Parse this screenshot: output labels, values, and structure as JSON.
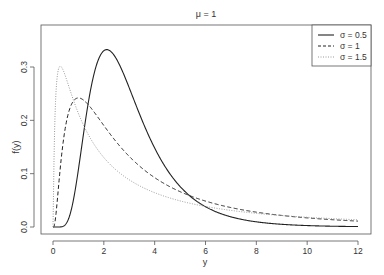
{
  "chart_data": {
    "type": "line",
    "title": "μ = 1",
    "xlabel": "y",
    "ylabel": "f(y)",
    "xlim": [
      -0.5,
      12.5
    ],
    "ylim": [
      0,
      0.35
    ],
    "xticks": [
      0,
      2,
      4,
      6,
      8,
      10,
      12
    ],
    "xtick_labels": [
      "0",
      "2",
      "4",
      "6",
      "8",
      "10",
      "12"
    ],
    "yticks": [
      0.0,
      0.1,
      0.2,
      0.3
    ],
    "ytick_labels": [
      "0.0",
      "0.1",
      "0.2",
      "0.3"
    ],
    "grid": false,
    "legend_position": "top-right",
    "distribution": "lognormal",
    "mu": 1,
    "series": [
      {
        "name": "σ = 0.5",
        "sigma": 0.5,
        "style": "solid",
        "x": [
          0,
          0.5,
          1,
          1.5,
          2,
          2.12,
          2.5,
          3,
          4,
          5,
          6,
          8,
          10,
          12
        ],
        "values": [
          0,
          0.0045,
          0.108,
          0.283,
          0.33,
          0.3326,
          0.315,
          0.252,
          0.135,
          0.065,
          0.03,
          0.006,
          0.0013,
          0.0003
        ]
      },
      {
        "name": "σ = 1",
        "sigma": 1,
        "style": "dashed",
        "x": [
          0,
          0.25,
          0.5,
          1,
          1.5,
          2,
          3,
          4,
          6,
          8,
          10,
          12
        ],
        "values": [
          0,
          0.111,
          0.201,
          0.242,
          0.222,
          0.189,
          0.132,
          0.095,
          0.053,
          0.032,
          0.021,
          0.014
        ]
      },
      {
        "name": "σ = 1.5",
        "sigma": 1.5,
        "style": "dotted",
        "x": [
          0,
          0.1,
          0.29,
          0.5,
          1,
          2,
          3,
          4,
          6,
          8,
          10,
          12
        ],
        "values": [
          0,
          0.228,
          0.3014,
          0.273,
          0.172,
          0.092,
          0.06,
          0.043,
          0.026,
          0.018,
          0.013,
          0.01
        ]
      }
    ]
  },
  "legend": {
    "items": [
      {
        "label": "σ = 0.5",
        "style": "solid"
      },
      {
        "label": "σ = 1",
        "style": "dashed"
      },
      {
        "label": "σ = 1.5",
        "style": "dotted"
      }
    ]
  }
}
